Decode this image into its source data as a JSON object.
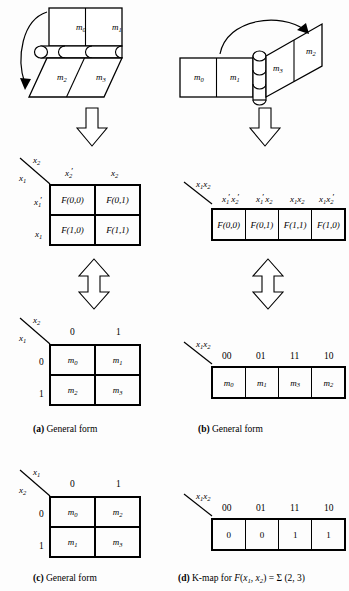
{
  "figure": {
    "title_implicit": "Two-variable K-map general forms",
    "line_color": "#000000",
    "background": "#fdfdfd"
  },
  "panel_a_fold": {
    "name": "horizontal-fold-diagram",
    "top_face_cells": [
      "m0",
      "m1"
    ],
    "bottom_face_cells": [
      "m2",
      "m3"
    ],
    "arrow": "curved-fold-arrow-down"
  },
  "panel_b_fold": {
    "name": "vertical-fold-diagram",
    "left_face_cells": [
      "m0",
      "m1"
    ],
    "right_face_cells": [
      "m3",
      "m2"
    ],
    "arrow": "curved-fold-arrow-right"
  },
  "panel_a": {
    "caption_tag": "(a)",
    "caption_text": " General form",
    "top_map": {
      "corner_top_label": "x2",
      "corner_bottom_label": "x1",
      "col_headers": [
        "x2'",
        "x2"
      ],
      "row_headers": [
        "x1'",
        "x1"
      ],
      "cells": [
        [
          "F(0,0)",
          "F(0,1)"
        ],
        [
          "F(1,0)",
          "F(1,1)"
        ]
      ]
    },
    "bottom_map": {
      "corner_top_label": "x2",
      "corner_bottom_label": "x1",
      "col_headers": [
        "0",
        "1"
      ],
      "row_headers": [
        "0",
        "1"
      ],
      "cells": [
        [
          "m0",
          "m1"
        ],
        [
          "m2",
          "m3"
        ]
      ]
    }
  },
  "panel_b": {
    "caption_tag": "(b)",
    "caption_text": " General form",
    "top_map": {
      "corner_label": "x1x2",
      "col_headers": [
        "x1'x2'",
        "x1'x2",
        "x1x2",
        "x1x2'"
      ],
      "cells": [
        "F(0,0)",
        "F(0,1)",
        "F(1,1)",
        "F(1,0)"
      ]
    },
    "bottom_map": {
      "corner_label": "x1x2",
      "col_headers": [
        "00",
        "01",
        "11",
        "10"
      ],
      "cells": [
        "m0",
        "m1",
        "m3",
        "m2"
      ]
    }
  },
  "panel_c": {
    "caption_tag": "(c)",
    "caption_text": " General form",
    "map": {
      "corner_top_label": "x1",
      "corner_bottom_label": "x2",
      "col_headers": [
        "0",
        "1"
      ],
      "row_headers": [
        "0",
        "1"
      ],
      "cells": [
        [
          "m0",
          "m2"
        ],
        [
          "m1",
          "m3"
        ]
      ]
    }
  },
  "panel_d": {
    "caption_tag": "(d)",
    "caption_text": " K-map for ",
    "caption_func": "F(x1, x2) = Σ (2, 3)",
    "map": {
      "corner_label": "x1x2",
      "col_headers": [
        "00",
        "01",
        "11",
        "10"
      ],
      "cells": [
        "0",
        "0",
        "1",
        "1"
      ]
    }
  },
  "arrows": {
    "down_arrow_a": "hollow-down-arrow",
    "down_arrow_b": "hollow-down-arrow",
    "double_arrow_a": "hollow-double-arrow",
    "double_arrow_b": "hollow-double-arrow"
  }
}
